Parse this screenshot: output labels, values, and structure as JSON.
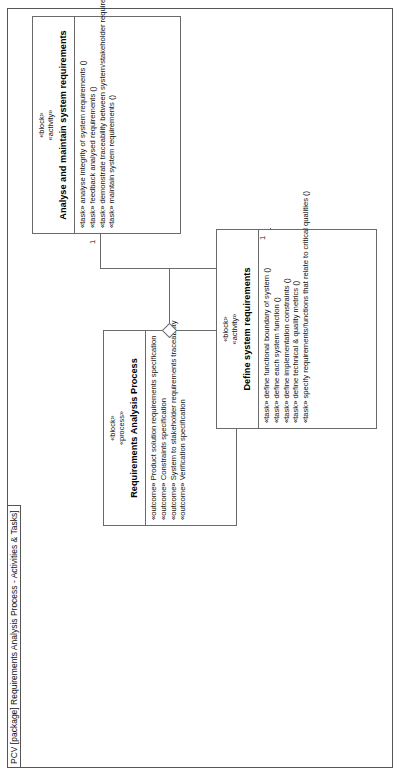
{
  "frame": {
    "keyword": "PCV",
    "title": "PCV [package] Requirements Analysis Process - Activities & Tasks]"
  },
  "diagram": {
    "type": "uml-block-definition-diagram",
    "orientation": "rotated-90-ccw"
  },
  "blocks": {
    "process": {
      "stereotype_1": "«block»",
      "stereotype_2": "«process»",
      "name": "Requirements Analysis Process",
      "features": [
        "«outcome» Product solution requirements specification",
        "«outcome» Constraints specification",
        "«outcome» System to stakeholder requirements traceability",
        "«outcome» Verification specification"
      ]
    },
    "analyse": {
      "stereotype_1": "«block»",
      "stereotype_2": "«activity»",
      "name": "Analyse and maintain system requirements",
      "features": [
        "«task» analyse integrity of system requirements ()",
        "«task» feedback analysed requirements ()",
        "«task» demonstrate traceability between system/stakeholder requirements ()",
        "«task» maintain system requirements ()"
      ]
    },
    "define": {
      "stereotype_1": "«block»",
      "stereotype_2": "«activity»",
      "name": "Define system requirements",
      "features": [
        "«task» define functional boundary of system ()",
        "«task» define each system function ()",
        "«task» define implementation constraints ()",
        "«task» define technical & quality metrics ()",
        "«task» specify requirements/functions that relate to critical qualities ()"
      ]
    }
  },
  "associations": [
    {
      "name": "process-to-analyse",
      "multiplicity": "1",
      "kind": "aggregation"
    },
    {
      "name": "process-to-define",
      "multiplicity": "1",
      "kind": "aggregation"
    }
  ],
  "multiplicities": {
    "analyse_end": "1",
    "define_end": "1"
  },
  "colors": {
    "line": "#6a6a6a",
    "frame": "#555555",
    "text": "#111111",
    "background": "#ffffff"
  }
}
